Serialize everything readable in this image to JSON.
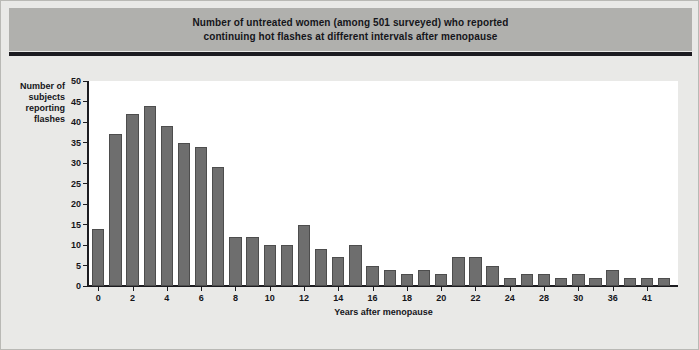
{
  "figure": {
    "title_line1": "Number of untreated women (among 501 surveyed) who reported",
    "title_line2": "continuing hot flashes at different intervals after menopause",
    "banner_color": "#b0b0ad",
    "background_color": "#e9e9e7",
    "bar_color": "#6e6e6e",
    "bar_edge_color": "#4d4d4d",
    "plot_background": "#ffffff",
    "axis_color": "#1c1c20"
  },
  "axis": {
    "y_title_line1": "Number of",
    "y_title_line2": "subjects",
    "y_title_line3": "reporting",
    "y_title_line4": "flashes",
    "x_title": "Years after menopause",
    "y_ticks": [
      0,
      5,
      10,
      15,
      20,
      25,
      30,
      35,
      40,
      45,
      50
    ],
    "x_tick_labels": [
      "0",
      "2",
      "4",
      "6",
      "8",
      "10",
      "12",
      "14",
      "16",
      "18",
      "20",
      "22",
      "24",
      "28",
      "30",
      "36",
      "41"
    ]
  },
  "chart_data": {
    "type": "bar",
    "title": "Number of untreated women (among 501 surveyed) who reported continuing hot flashes at different intervals after menopause",
    "xlabel": "Years after menopause",
    "ylabel": "Number of subjects reporting flashes",
    "ylim": [
      0,
      50
    ],
    "ytick_step": 5,
    "grid": false,
    "legend": null,
    "categories": [
      "0",
      "1",
      "2",
      "3",
      "4",
      "5",
      "6",
      "7",
      "8",
      "9",
      "10",
      "11",
      "12",
      "13",
      "14",
      "15",
      "16",
      "17",
      "18",
      "19",
      "20",
      "21",
      "22",
      "23",
      "24",
      "26",
      "28",
      "29",
      "30",
      "32",
      "36",
      "38",
      "41",
      "43"
    ],
    "values": [
      14,
      37,
      42,
      44,
      39,
      35,
      34,
      29,
      12,
      12,
      10,
      10,
      15,
      9,
      7,
      10,
      5,
      4,
      3,
      4,
      3,
      7,
      7,
      5,
      2,
      3,
      3,
      2,
      3,
      2,
      4,
      2,
      2,
      2
    ],
    "tick_positions": [
      0,
      2,
      4,
      6,
      8,
      10,
      12,
      14,
      16,
      18,
      20,
      22,
      24,
      26,
      28,
      30,
      32
    ]
  }
}
